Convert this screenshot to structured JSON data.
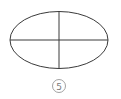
{
  "figure": {
    "label": "5",
    "ellipse": {
      "cx": 59,
      "cy": 40,
      "rx": 49,
      "ry": 28.5
    },
    "stroke_color": "#3a3a3a",
    "label_color": "#7a7a7a"
  }
}
